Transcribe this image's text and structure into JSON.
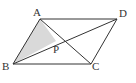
{
  "figure": {
    "points": {
      "A": {
        "label": "A",
        "x": 40,
        "y": 19
      },
      "B": {
        "label": "B",
        "x": 13,
        "y": 64
      },
      "C": {
        "label": "C",
        "x": 91,
        "y": 64
      },
      "D": {
        "label": "D",
        "x": 117,
        "y": 19
      },
      "P": {
        "label": "P",
        "x": 56,
        "y": 41
      }
    },
    "shaded_region": [
      "A",
      "B",
      "P"
    ],
    "colors": {
      "stroke": "#333333",
      "shade": "#d9d9d9",
      "background": "#ffffff"
    }
  }
}
